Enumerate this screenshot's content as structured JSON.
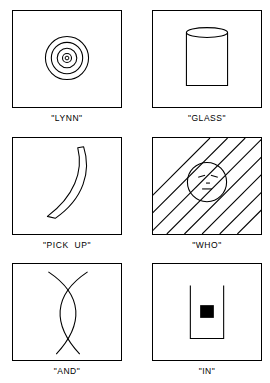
{
  "figure": {
    "background_color": "#ffffff",
    "ink_color": "#000000",
    "columns": 2,
    "rows": 3
  },
  "panels": [
    {
      "id": "lynn",
      "caption": "\"LYNN\"",
      "drawing_name": "concentric-circles-drawing",
      "description": "four concentric circles with small dot at center",
      "ring_count": 4
    },
    {
      "id": "glass",
      "caption": "\"GLASS\"",
      "drawing_name": "cylinder-glass-drawing",
      "description": "upright cylinder with elliptical open rim at top",
      "ring_count": 0
    },
    {
      "id": "pick-up",
      "caption": "\"PICK  UP\"",
      "drawing_name": "crescent-curve-drawing",
      "description": "curved crescent band tapering toward lower left",
      "ring_count": 0
    },
    {
      "id": "who",
      "caption": "\"WHO\"",
      "drawing_name": "face-behind-hatching-drawing",
      "description": "circular face with two eyes and mouth behind diagonal hatch lines",
      "hatch_line_count": 8
    },
    {
      "id": "and",
      "caption": "\"AND\"",
      "drawing_name": "crossing-arcs-drawing",
      "description": "two long arcs crossing near top and bottom forming a lens shape",
      "ring_count": 0
    },
    {
      "id": "in",
      "caption": "\"IN\"",
      "drawing_name": "square-in-container-drawing",
      "description": "open U-shaped container with solid black square inside",
      "ring_count": 0
    }
  ]
}
